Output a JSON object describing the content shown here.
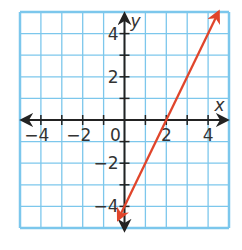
{
  "chart_data": {
    "type": "line",
    "title": "",
    "xlabel": "x",
    "ylabel": "y",
    "xlim": [
      -5,
      5
    ],
    "ylim": [
      -5,
      5
    ],
    "grid": true,
    "x_ticks": [
      -4,
      -2,
      0,
      2,
      4
    ],
    "y_ticks": [
      -4,
      -2,
      2,
      4
    ],
    "x_tick_labels": [
      "−4",
      "−2",
      "0",
      "2",
      "4"
    ],
    "y_tick_labels": [
      "−4",
      "−2",
      "2",
      "4"
    ],
    "series": [
      {
        "name": "y = 2x − 4",
        "equation": "y = 2x - 4",
        "slope": 2,
        "y_intercept": -4,
        "x_intercept": 2,
        "points": [
          [
            -0.3,
            -4.6
          ],
          [
            0,
            -4
          ],
          [
            2,
            0
          ],
          [
            4,
            4
          ],
          [
            4.5,
            5
          ]
        ],
        "arrows_both_ends": true
      }
    ]
  },
  "colors": {
    "grid": "#7cc7ec",
    "axes": "#222222",
    "line": "#e0452b",
    "background": "#ffffff"
  }
}
